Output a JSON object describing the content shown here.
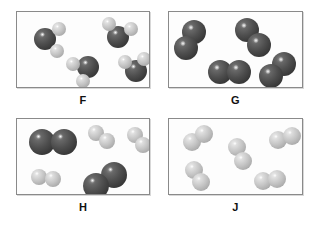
{
  "figure": {
    "background_color": "#ffffff",
    "panel_border_color": "#8a8a8a",
    "atom_dark_color": "#4e4e4e",
    "atom_light_color": "#c4c4c4"
  },
  "panels": [
    {
      "id": "F",
      "label": "F",
      "frame": {
        "x": 16,
        "y": 11,
        "w": 134,
        "h": 77
      },
      "description": "four identical triatomic molecules, each one dark atom bonded to two light atoms",
      "molecule_count": 4,
      "molecules": [
        {
          "type": "triatomic",
          "atoms": [
            {
              "shade": "dark",
              "cx": 28,
              "cy": 27,
              "r": 11
            },
            {
              "shade": "light",
              "cx": 42,
              "cy": 17,
              "r": 7
            },
            {
              "shade": "light",
              "cx": 40,
              "cy": 39,
              "r": 7
            }
          ]
        },
        {
          "type": "triatomic",
          "atoms": [
            {
              "shade": "dark",
              "cx": 101,
              "cy": 25,
              "r": 11
            },
            {
              "shade": "light",
              "cx": 92,
              "cy": 12,
              "r": 7
            },
            {
              "shade": "light",
              "cx": 114,
              "cy": 17,
              "r": 7
            }
          ]
        },
        {
          "type": "triatomic",
          "atoms": [
            {
              "shade": "dark",
              "cx": 71,
              "cy": 55,
              "r": 11
            },
            {
              "shade": "light",
              "cx": 56,
              "cy": 52,
              "r": 7
            },
            {
              "shade": "light",
              "cx": 66,
              "cy": 69,
              "r": 7
            }
          ]
        },
        {
          "type": "triatomic",
          "atoms": [
            {
              "shade": "dark",
              "cx": 119,
              "cy": 59,
              "r": 11
            },
            {
              "shade": "light",
              "cx": 108,
              "cy": 50,
              "r": 7
            },
            {
              "shade": "light",
              "cx": 127,
              "cy": 47,
              "r": 7
            }
          ]
        }
      ]
    },
    {
      "id": "G",
      "label": "G",
      "frame": {
        "x": 168,
        "y": 11,
        "w": 135,
        "h": 77
      },
      "description": "four identical diatomic molecules made of two dark atoms",
      "molecule_count": 4,
      "molecules": [
        {
          "type": "diatomic",
          "atoms": [
            {
              "shade": "dark",
              "cx": 25,
              "cy": 20,
              "r": 12
            },
            {
              "shade": "dark",
              "cx": 17,
              "cy": 36,
              "r": 12
            }
          ]
        },
        {
          "type": "diatomic",
          "atoms": [
            {
              "shade": "dark",
              "cx": 78,
              "cy": 18,
              "r": 12
            },
            {
              "shade": "dark",
              "cx": 90,
              "cy": 33,
              "r": 12
            }
          ]
        },
        {
          "type": "diatomic",
          "atoms": [
            {
              "shade": "dark",
              "cx": 51,
              "cy": 60,
              "r": 12
            },
            {
              "shade": "dark",
              "cx": 70,
              "cy": 60,
              "r": 12
            }
          ]
        },
        {
          "type": "diatomic",
          "atoms": [
            {
              "shade": "dark",
              "cx": 115,
              "cy": 52,
              "r": 12
            },
            {
              "shade": "dark",
              "cx": 102,
              "cy": 64,
              "r": 12
            }
          ]
        }
      ]
    },
    {
      "id": "H",
      "label": "H",
      "frame": {
        "x": 16,
        "y": 118,
        "w": 134,
        "h": 77
      },
      "description": "mixture of two dark diatomic molecules and three light diatomic molecules",
      "molecule_count": 5,
      "molecules": [
        {
          "type": "diatomic",
          "atoms": [
            {
              "shade": "dark",
              "cx": 25,
              "cy": 23,
              "r": 13
            },
            {
              "shade": "dark",
              "cx": 47,
              "cy": 23,
              "r": 13
            }
          ]
        },
        {
          "type": "diatomic",
          "atoms": [
            {
              "shade": "dark",
              "cx": 97,
              "cy": 56,
              "r": 13
            },
            {
              "shade": "dark",
              "cx": 79,
              "cy": 67,
              "r": 13
            }
          ]
        },
        {
          "type": "diatomic",
          "atoms": [
            {
              "shade": "light",
              "cx": 79,
              "cy": 14,
              "r": 8
            },
            {
              "shade": "light",
              "cx": 90,
              "cy": 22,
              "r": 8
            }
          ]
        },
        {
          "type": "diatomic",
          "atoms": [
            {
              "shade": "light",
              "cx": 118,
              "cy": 16,
              "r": 8
            },
            {
              "shade": "light",
              "cx": 126,
              "cy": 26,
              "r": 8
            }
          ]
        },
        {
          "type": "diatomic",
          "atoms": [
            {
              "shade": "light",
              "cx": 22,
              "cy": 58,
              "r": 8
            },
            {
              "shade": "light",
              "cx": 36,
              "cy": 60,
              "r": 8
            }
          ]
        }
      ]
    },
    {
      "id": "J",
      "label": "J",
      "frame": {
        "x": 168,
        "y": 118,
        "w": 135,
        "h": 77
      },
      "description": "five identical diatomic molecules made of two light atoms",
      "molecule_count": 5,
      "molecules": [
        {
          "type": "diatomic",
          "atoms": [
            {
              "shade": "light",
              "cx": 23,
              "cy": 23,
              "r": 9
            },
            {
              "shade": "light",
              "cx": 35,
              "cy": 15,
              "r": 9
            }
          ]
        },
        {
          "type": "diatomic",
          "atoms": [
            {
              "shade": "light",
              "cx": 68,
              "cy": 28,
              "r": 9
            },
            {
              "shade": "light",
              "cx": 74,
              "cy": 42,
              "r": 9
            }
          ]
        },
        {
          "type": "diatomic",
          "atoms": [
            {
              "shade": "light",
              "cx": 109,
              "cy": 21,
              "r": 9
            },
            {
              "shade": "light",
              "cx": 123,
              "cy": 17,
              "r": 9
            }
          ]
        },
        {
          "type": "diatomic",
          "atoms": [
            {
              "shade": "light",
              "cx": 25,
              "cy": 51,
              "r": 9
            },
            {
              "shade": "light",
              "cx": 32,
              "cy": 63,
              "r": 9
            }
          ]
        },
        {
          "type": "diatomic",
          "atoms": [
            {
              "shade": "light",
              "cx": 94,
              "cy": 62,
              "r": 9
            },
            {
              "shade": "light",
              "cx": 108,
              "cy": 60,
              "r": 9
            }
          ]
        }
      ]
    }
  ]
}
